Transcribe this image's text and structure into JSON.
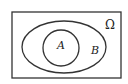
{
  "diagram": {
    "type": "venn",
    "universe": {
      "label": "Ω",
      "x": 12,
      "y": 12,
      "width": 109,
      "height": 66
    },
    "sets": [
      {
        "label": "B",
        "shape": "ellipse",
        "cx": 64,
        "cy": 47,
        "rx": 42,
        "ry": 26,
        "label_x": 95,
        "label_y": 53
      },
      {
        "label": "A",
        "shape": "circle",
        "cx": 61,
        "cy": 48,
        "r": 18,
        "label_x": 60,
        "label_y": 48
      }
    ],
    "relation": "A ⊂ B ⊂ Ω",
    "stroke_color": "#333333",
    "background": "#ffffff"
  }
}
